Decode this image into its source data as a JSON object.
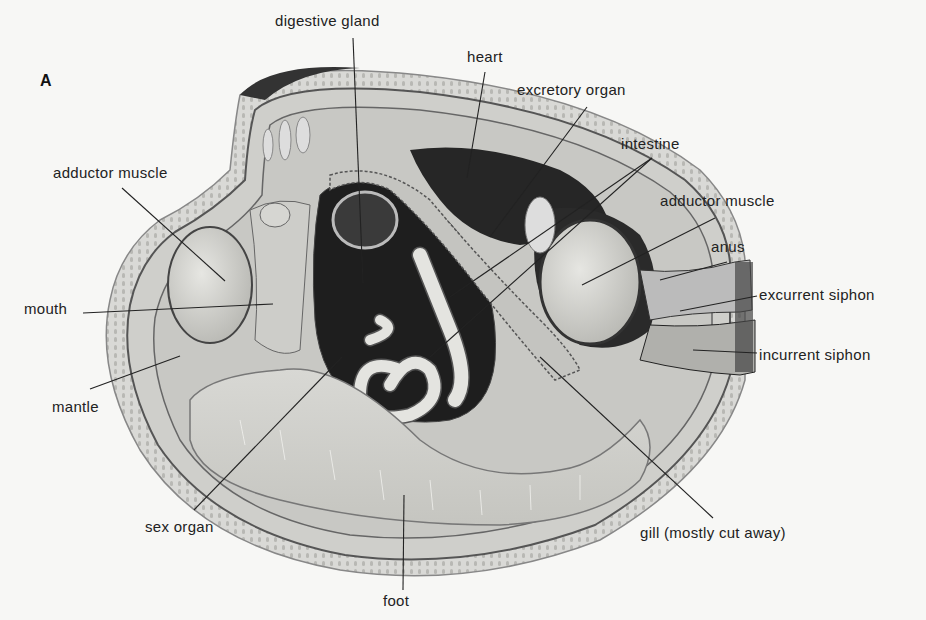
{
  "figure": {
    "panel_letter": "A",
    "labels": [
      {
        "id": "digestive-gland",
        "text": "digestive gland"
      },
      {
        "id": "heart",
        "text": "heart"
      },
      {
        "id": "excretory-organ",
        "text": "excretory organ"
      },
      {
        "id": "intestine",
        "text": "intestine"
      },
      {
        "id": "adductor-muscle-left",
        "text": "adductor muscle"
      },
      {
        "id": "adductor-muscle-right",
        "text": "adductor muscle"
      },
      {
        "id": "anus",
        "text": "anus"
      },
      {
        "id": "excurrent-siphon",
        "text": "excurrent siphon"
      },
      {
        "id": "incurrent-siphon",
        "text": "incurrent siphon"
      },
      {
        "id": "mouth",
        "text": "mouth"
      },
      {
        "id": "mantle",
        "text": "mantle"
      },
      {
        "id": "sex-organ",
        "text": "sex organ"
      },
      {
        "id": "foot",
        "text": "foot"
      },
      {
        "id": "gill",
        "text": "gill (mostly cut away)"
      }
    ]
  }
}
